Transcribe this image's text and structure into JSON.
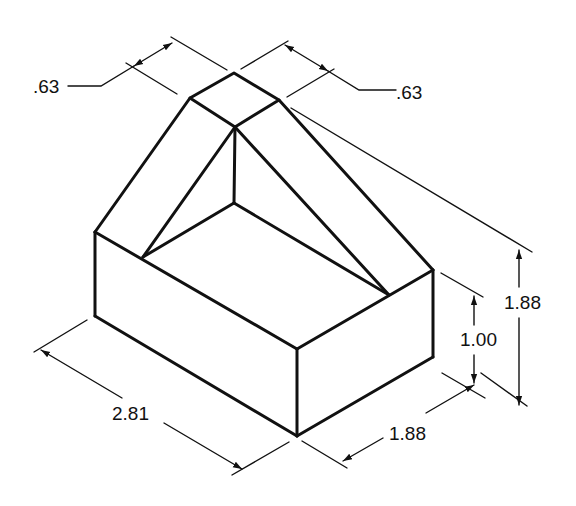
{
  "figure": {
    "type": "isometric-technical-drawing",
    "object": "rectangular block with sloped triangular ridge",
    "line_color": "#111111",
    "background": "#ffffff"
  },
  "dimensions": {
    "top_left_width": {
      "label": ".63"
    },
    "top_right_width": {
      "label": ".63"
    },
    "overall_height": {
      "label": "1.88"
    },
    "base_height": {
      "label": "1.00"
    },
    "length": {
      "label": "2.81"
    },
    "depth": {
      "label": "1.88"
    }
  }
}
